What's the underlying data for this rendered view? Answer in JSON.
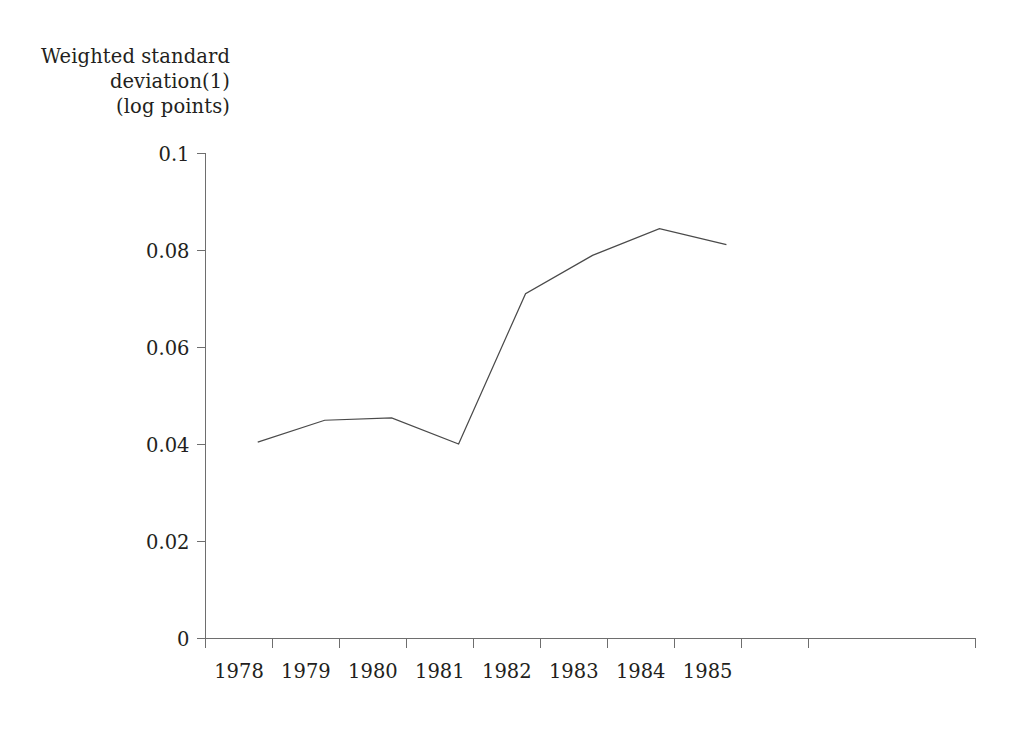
{
  "chart_data": {
    "type": "line",
    "title": "",
    "ylabel": "Weighted standard\ndeviation(1)\n(log points)",
    "xlabel": "",
    "categories": [
      "1978",
      "1979",
      "1980",
      "1981",
      "1982",
      "1983",
      "1984",
      "1985"
    ],
    "x": [
      1978,
      1979,
      1980,
      1981,
      1982,
      1983,
      1984,
      1985
    ],
    "values": [
      0.0405,
      0.045,
      0.0455,
      0.0401,
      0.0711,
      0.079,
      0.0845,
      0.0812
    ],
    "series": [
      {
        "name": "Weighted standard deviation (log points)",
        "values": [
          0.0405,
          0.045,
          0.0455,
          0.0401,
          0.0711,
          0.079,
          0.0845,
          0.0812
        ]
      }
    ],
    "ylim": [
      0,
      0.1
    ],
    "ytick_labels": [
      "0",
      "0.02",
      "0.04",
      "0.06",
      "0.08",
      "0.1"
    ],
    "ytick_values": [
      0,
      0.02,
      0.04,
      0.06,
      0.08,
      0.1
    ],
    "grid": false,
    "legend": false,
    "legend_position": "none",
    "line_color": "#4a4a4a",
    "axis_color": "#6e6e6e",
    "background_color": "#ffffff"
  },
  "axis": {
    "y_label_line1": "Weighted standard",
    "y_label_line2": "deviation(1)",
    "y_label_line3": "(log points)"
  }
}
